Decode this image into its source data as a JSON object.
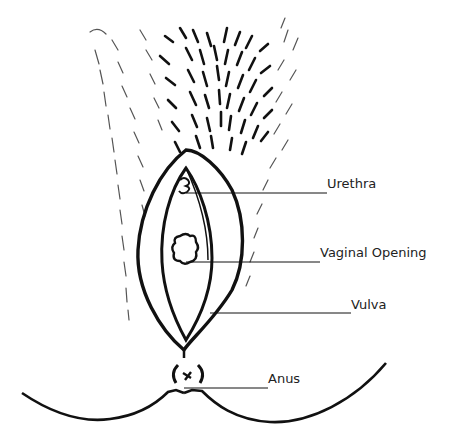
{
  "diagram": {
    "type": "anatomical line drawing",
    "style": "black ink on white",
    "colors": {
      "ink": "#111111",
      "background": "#ffffff",
      "label_text": "#222222"
    },
    "labels": [
      {
        "id": "urethra",
        "text": "Urethra",
        "x": 327,
        "y": 177
      },
      {
        "id": "vaginal_opening",
        "text": "Vaginal Opening",
        "x": 320,
        "y": 243
      },
      {
        "id": "vulva",
        "text": "Vulva",
        "x": 351,
        "y": 298
      },
      {
        "id": "anus",
        "text": "Anus",
        "x": 268,
        "y": 372
      }
    ]
  }
}
